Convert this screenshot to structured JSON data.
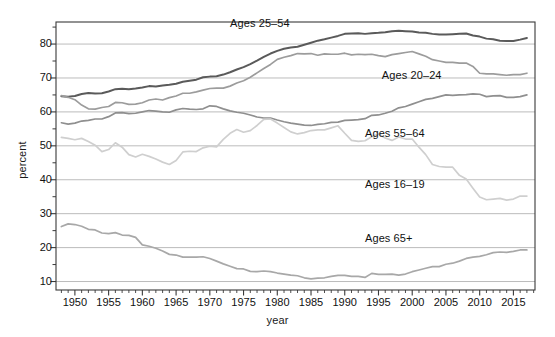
{
  "chart_data": {
    "type": "line",
    "title": "",
    "xlabel": "year",
    "ylabel": "percent",
    "xlim": [
      1947.2,
      2018.2
    ],
    "ylim": [
      7.5,
      86.5
    ],
    "grid": "horizontal",
    "y_major_ticks": [
      10,
      20,
      30,
      40,
      50,
      60,
      70,
      80
    ],
    "y_minor_ticks": [
      15,
      25,
      35,
      45,
      55,
      65,
      75,
      85
    ],
    "x_major_ticks": [
      1950,
      1955,
      1960,
      1965,
      1970,
      1975,
      1980,
      1985,
      1990,
      1995,
      2000,
      2005,
      2010,
      2015
    ],
    "x_minor_tick_step": 1,
    "legend_position": "inline-annotations",
    "series": [
      {
        "name": "Ages 25-54",
        "label": "Ages 25–54",
        "color": "#5a5a5a",
        "width": 2.0,
        "label_x": 1973.0,
        "label_y": 86.0,
        "x": [
          1948,
          1949,
          1950,
          1951,
          1952,
          1953,
          1954,
          1955,
          1956,
          1957,
          1958,
          1959,
          1960,
          1961,
          1962,
          1963,
          1964,
          1965,
          1966,
          1967,
          1968,
          1969,
          1970,
          1971,
          1972,
          1973,
          1974,
          1975,
          1976,
          1977,
          1978,
          1979,
          1980,
          1981,
          1982,
          1983,
          1984,
          1985,
          1986,
          1987,
          1988,
          1989,
          1990,
          1991,
          1992,
          1993,
          1994,
          1995,
          1996,
          1997,
          1998,
          1999,
          2000,
          2001,
          2002,
          2003,
          2004,
          2005,
          2006,
          2007,
          2008,
          2009,
          2010,
          2011,
          2012,
          2013,
          2014,
          2015,
          2016,
          2017
        ],
        "y": [
          64.6,
          64.5,
          64.7,
          65.3,
          65.6,
          65.4,
          65.5,
          66.0,
          66.7,
          66.8,
          66.7,
          66.9,
          67.2,
          67.6,
          67.5,
          67.8,
          68.0,
          68.3,
          68.9,
          69.2,
          69.5,
          70.2,
          70.4,
          70.5,
          71.0,
          71.7,
          72.5,
          73.2,
          74.1,
          75.1,
          76.2,
          77.2,
          78.0,
          78.6,
          79.0,
          79.2,
          79.8,
          80.4,
          81.0,
          81.4,
          81.9,
          82.4,
          83.0,
          83.1,
          83.2,
          83.0,
          83.2,
          83.3,
          83.5,
          83.8,
          83.9,
          83.8,
          83.7,
          83.4,
          83.3,
          83.0,
          82.8,
          82.8,
          82.9,
          83.0,
          83.1,
          82.5,
          82.2,
          81.6,
          81.4,
          81.0,
          80.9,
          80.9,
          81.3,
          81.8
        ]
      },
      {
        "name": "Ages 20-24",
        "label": "Ages 20–24",
        "color": "#9c9c9c",
        "width": 1.7,
        "label_x": 1995.5,
        "label_y": 70.5,
        "x": [
          1948,
          1949,
          1950,
          1951,
          1952,
          1953,
          1954,
          1955,
          1956,
          1957,
          1958,
          1959,
          1960,
          1961,
          1962,
          1963,
          1964,
          1965,
          1966,
          1967,
          1968,
          1969,
          1970,
          1971,
          1972,
          1973,
          1974,
          1975,
          1976,
          1977,
          1978,
          1979,
          1980,
          1981,
          1982,
          1983,
          1984,
          1985,
          1986,
          1987,
          1988,
          1989,
          1990,
          1991,
          1992,
          1993,
          1994,
          1995,
          1996,
          1997,
          1998,
          1999,
          2000,
          2001,
          2002,
          2003,
          2004,
          2005,
          2006,
          2007,
          2008,
          2009,
          2010,
          2011,
          2012,
          2013,
          2014,
          2015,
          2016,
          2017
        ],
        "y": [
          64.8,
          64.3,
          63.6,
          62.0,
          60.9,
          60.8,
          61.3,
          61.6,
          62.8,
          62.7,
          62.2,
          62.3,
          62.7,
          63.5,
          63.8,
          63.5,
          64.2,
          64.7,
          65.5,
          65.5,
          65.9,
          66.4,
          66.9,
          67.0,
          67.0,
          67.6,
          68.5,
          69.2,
          70.2,
          71.5,
          72.8,
          74.0,
          75.5,
          76.1,
          76.6,
          77.2,
          77.1,
          77.2,
          76.7,
          77.1,
          77.0,
          77.0,
          77.3,
          76.8,
          77.0,
          76.9,
          77.0,
          76.6,
          76.3,
          76.9,
          77.2,
          77.5,
          77.8,
          77.1,
          76.4,
          75.4,
          75.0,
          74.6,
          74.6,
          74.4,
          74.4,
          73.4,
          71.4,
          71.2,
          71.2,
          71.0,
          70.8,
          71.0,
          71.0,
          71.4
        ]
      },
      {
        "name": "Ages 55-64",
        "label": "Ages 55–64",
        "color": "#8f8f8f",
        "width": 1.7,
        "label_x": 1993.0,
        "label_y": 53.5,
        "x": [
          1948,
          1949,
          1950,
          1951,
          1952,
          1953,
          1954,
          1955,
          1956,
          1957,
          1958,
          1959,
          1960,
          1961,
          1962,
          1963,
          1964,
          1965,
          1966,
          1967,
          1968,
          1969,
          1970,
          1971,
          1972,
          1973,
          1974,
          1975,
          1976,
          1977,
          1978,
          1979,
          1980,
          1981,
          1982,
          1983,
          1984,
          1985,
          1986,
          1987,
          1988,
          1989,
          1990,
          1991,
          1992,
          1993,
          1994,
          1995,
          1996,
          1997,
          1998,
          1999,
          2000,
          2001,
          2002,
          2003,
          2004,
          2005,
          2006,
          2007,
          2008,
          2009,
          2010,
          2011,
          2012,
          2013,
          2014,
          2015,
          2016,
          2017
        ],
        "y": [
          56.8,
          56.4,
          56.7,
          57.3,
          57.5,
          57.9,
          57.9,
          58.6,
          59.7,
          59.8,
          59.5,
          59.6,
          60.0,
          60.4,
          60.2,
          60.0,
          59.9,
          60.6,
          61.0,
          60.8,
          60.7,
          60.9,
          61.8,
          61.6,
          60.9,
          60.3,
          59.9,
          59.6,
          59.1,
          58.5,
          58.2,
          58.2,
          57.6,
          57.1,
          56.7,
          56.4,
          56.1,
          56.0,
          56.3,
          56.5,
          56.9,
          57.0,
          57.5,
          57.6,
          57.7,
          58.0,
          59.0,
          59.1,
          59.6,
          60.2,
          61.2,
          61.6,
          62.3,
          63.0,
          63.7,
          64.0,
          64.5,
          65.0,
          64.9,
          65.0,
          65.1,
          65.3,
          65.2,
          64.5,
          64.7,
          64.8,
          64.3,
          64.3,
          64.5,
          65.0
        ]
      },
      {
        "name": "Ages 16-19",
        "label": "Ages 16–19",
        "color": "#cfcfcf",
        "width": 1.7,
        "label_x": 1993.0,
        "label_y": 38.5,
        "x": [
          1948,
          1949,
          1950,
          1951,
          1952,
          1953,
          1954,
          1955,
          1956,
          1957,
          1958,
          1959,
          1960,
          1961,
          1962,
          1963,
          1964,
          1965,
          1966,
          1967,
          1968,
          1969,
          1970,
          1971,
          1972,
          1973,
          1974,
          1975,
          1976,
          1977,
          1978,
          1979,
          1980,
          1981,
          1982,
          1983,
          1984,
          1985,
          1986,
          1987,
          1988,
          1989,
          1990,
          1991,
          1992,
          1993,
          1994,
          1995,
          1996,
          1997,
          1998,
          1999,
          2000,
          2001,
          2002,
          2003,
          2004,
          2005,
          2006,
          2007,
          2008,
          2009,
          2010,
          2011,
          2012,
          2013,
          2014,
          2015,
          2016,
          2017
        ],
        "y": [
          52.5,
          52.2,
          51.8,
          52.2,
          51.3,
          50.2,
          48.3,
          48.9,
          50.9,
          49.6,
          47.4,
          46.7,
          47.5,
          46.9,
          46.1,
          45.2,
          44.5,
          45.7,
          48.2,
          48.4,
          48.3,
          49.4,
          49.9,
          49.7,
          51.9,
          53.7,
          54.8,
          54.0,
          54.5,
          56.0,
          57.8,
          57.9,
          56.7,
          55.4,
          54.1,
          53.5,
          53.9,
          54.5,
          54.7,
          54.7,
          55.3,
          55.9,
          53.7,
          51.6,
          51.3,
          51.5,
          52.7,
          53.5,
          52.3,
          51.6,
          52.6,
          52.0,
          52.0,
          49.6,
          47.4,
          44.5,
          43.9,
          43.7,
          43.7,
          41.3,
          40.2,
          37.5,
          34.9,
          34.1,
          34.3,
          34.5,
          34.0,
          34.3,
          35.2,
          35.2
        ]
      },
      {
        "name": "Ages 65+",
        "label": "Ages 65+",
        "color": "#a8a8a8",
        "width": 1.7,
        "label_x": 1993.0,
        "label_y": 22.5,
        "x": [
          1948,
          1949,
          1950,
          1951,
          1952,
          1953,
          1954,
          1955,
          1956,
          1957,
          1958,
          1959,
          1960,
          1961,
          1962,
          1963,
          1964,
          1965,
          1966,
          1967,
          1968,
          1969,
          1970,
          1971,
          1972,
          1973,
          1974,
          1975,
          1976,
          1977,
          1978,
          1979,
          1980,
          1981,
          1982,
          1983,
          1984,
          1985,
          1986,
          1987,
          1988,
          1989,
          1990,
          1991,
          1992,
          1993,
          1994,
          1995,
          1996,
          1997,
          1998,
          1999,
          2000,
          2001,
          2002,
          2003,
          2004,
          2005,
          2006,
          2007,
          2008,
          2009,
          2010,
          2011,
          2012,
          2013,
          2014,
          2015,
          2016,
          2017
        ],
        "y": [
          26.2,
          27.0,
          26.8,
          26.3,
          25.4,
          25.2,
          24.3,
          24.1,
          24.4,
          23.7,
          23.6,
          23.0,
          20.8,
          20.4,
          19.8,
          19.0,
          18.0,
          17.8,
          17.2,
          17.2,
          17.2,
          17.3,
          16.8,
          16.0,
          15.2,
          14.5,
          13.8,
          13.7,
          13.0,
          12.9,
          13.1,
          12.9,
          12.5,
          12.2,
          11.9,
          11.7,
          11.1,
          10.8,
          11.0,
          11.1,
          11.5,
          11.8,
          11.8,
          11.5,
          11.5,
          11.2,
          12.4,
          12.1,
          12.1,
          12.2,
          11.9,
          12.2,
          12.9,
          13.4,
          13.9,
          14.4,
          14.4,
          15.1,
          15.4,
          16.0,
          16.8,
          17.2,
          17.4,
          17.9,
          18.5,
          18.7,
          18.6,
          18.9,
          19.3,
          19.3
        ]
      }
    ]
  },
  "axes": {
    "y_title": "percent",
    "x_title": "year",
    "y_tick_labels": [
      "80",
      "70",
      "60",
      "50",
      "40",
      "30",
      "20",
      "10"
    ],
    "x_tick_labels": [
      "1950",
      "1955",
      "1960",
      "1965",
      "1970",
      "1975",
      "1980",
      "1985",
      "1990",
      "1995",
      "2000",
      "2005",
      "2010",
      "2015"
    ]
  },
  "style": {
    "frame_color": "#3a3a3a",
    "grid_color": "#b4b4b4",
    "background": "#ffffff"
  }
}
